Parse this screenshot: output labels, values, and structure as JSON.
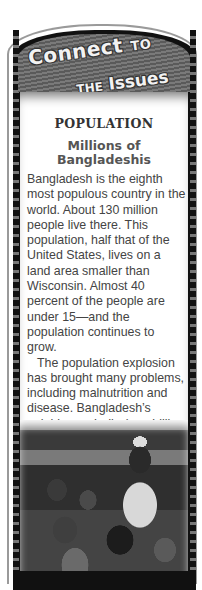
{
  "banner": {
    "line1_main": "Connect",
    "line1_small": "TO",
    "line2_small": "THE",
    "line2_main": "Issues"
  },
  "topic": "POPULATION",
  "subhead": {
    "line1": "Millions of",
    "line2": "Bangladeshis"
  },
  "paragraphs": [
    "Bangladesh is the eighth most populous country in the world. About 130 million people live there. This population, half that of the United States, lives on a land area smaller than Wisconsin. Almost 40 percent of the people are under 15—and the population continues to grow.",
    "The population explosion has brought many problems, including malnutrition and disease. Bangladesh’s neighbors—India (one billion people) and Pakistan (about 150 million)—also have rapidly expanding populations."
  ],
  "photo": {
    "description": "Black-and-white photo of a man and several children in front of a thatched hut in Bangladesh"
  }
}
